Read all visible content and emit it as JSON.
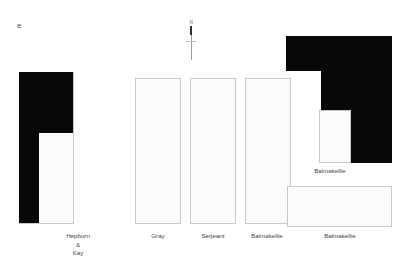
{
  "figure": {
    "letter": "e",
    "north_arrow": {
      "name": "north-arrow",
      "label": "N"
    }
  },
  "plots": [
    {
      "id": "hepburn-kay",
      "label_lines": [
        "Hepburn",
        "&",
        "Kay"
      ],
      "fill": "#080808",
      "outline": "#c9c9c9",
      "shape": "reverse-L"
    },
    {
      "id": "gray",
      "label_lines": [
        "Gray"
      ],
      "fill": "#fbfbfb",
      "outline": "#c9c9c9",
      "shape": "rectangle"
    },
    {
      "id": "serjeant",
      "label_lines": [
        "Serjeant"
      ],
      "fill": "#fbfbfb",
      "outline": "#c9c9c9",
      "shape": "rectangle"
    },
    {
      "id": "balmakellie-1",
      "label_lines": [
        "Balmakellie"
      ],
      "fill": "#fbfbfb",
      "outline": "#c9c9c9",
      "shape": "rectangle"
    },
    {
      "id": "balmakellie-2",
      "label_lines": [
        "Balmakellie"
      ],
      "fill": "#080808",
      "outline": "#c9c9c9",
      "shape": "L-block-with-inner-court"
    }
  ],
  "labels": {
    "hepburn_line1": "Hepburn",
    "hepburn_line2": "&",
    "hepburn_line3": "Kay",
    "gray": "Gray",
    "serjeant": "Serjeant",
    "balmakellie_1": "Balmakellie",
    "balmakellie_2": "Balmakellie",
    "balmakellie_inner": "Balmakellie"
  },
  "colors": {
    "ink": "#080808",
    "paper": "#fbfbfb",
    "outline": "#c9c9c9",
    "text": "#3f3f3f"
  }
}
